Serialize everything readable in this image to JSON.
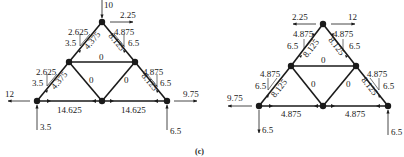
{
  "caption": "(c)",
  "colors": {
    "ink": "#1a1a1a",
    "background": "#ffffff"
  },
  "left_truss": {
    "loads": {
      "top_vertical": "10",
      "top_horizontal": "2.25",
      "left_horizontal": "12",
      "right_horizontal": "9.75",
      "left_reaction": "3.5",
      "right_reaction": "6.5"
    },
    "members": {
      "top_left_diag": "4.375",
      "top_right_diag": "8.125",
      "mid_horizontal": "0",
      "lower_left_diag": "4.375",
      "lower_inner_left": "0",
      "lower_inner_right": "0",
      "lower_right_diag": "8.125",
      "bottom_left": "14.625",
      "bottom_right": "14.625"
    },
    "components": {
      "top_left_h": "2.625",
      "top_left_v": "3.5",
      "top_right_h": "4.875",
      "top_right_v": "6.5",
      "lower_left_h": "2.625",
      "lower_left_v": "3.5",
      "lower_right_h": "4.875",
      "lower_right_v": "6.5"
    }
  },
  "right_truss": {
    "loads": {
      "top_left_horizontal": "2.25",
      "top_right_horizontal": "12",
      "left_horizontal": "9.75",
      "left_vertical": "6.5",
      "right_reaction": "6.5"
    },
    "members": {
      "top_left_diag": "8.125",
      "top_right_diag": "8.125",
      "mid_horizontal": "0",
      "lower_left_diag": "8.125",
      "lower_inner_left": "0",
      "lower_inner_right": "0",
      "lower_right_diag": "8.125",
      "bottom_left": "4.875",
      "bottom_right": "4.875"
    },
    "components": {
      "top_left_h": "4.875",
      "top_left_v": "6.5",
      "top_right_h": "4.875",
      "top_right_v": "6.5",
      "lower_left_h": "4.875",
      "lower_left_v": "6.5",
      "lower_right_h": "4.875",
      "lower_right_v": "6.5"
    }
  }
}
